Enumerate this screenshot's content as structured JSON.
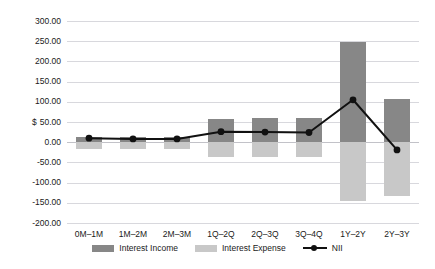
{
  "chart_data": {
    "type": "bar",
    "title": "",
    "xlabel": "",
    "ylabel": "$",
    "ylim": [
      -200,
      300
    ],
    "ytick_step": 50,
    "grid": true,
    "legend_position": "bottom",
    "categories": [
      "0M–1M",
      "1M–2M",
      "2M–3M",
      "1Q–2Q",
      "2Q–3Q",
      "3Q–4Q",
      "1Y–2Y",
      "2Y–3Y"
    ],
    "ytick_labels": [
      "300.00",
      "250.00",
      "200.00",
      "150.00",
      "100.00",
      "50.00",
      "0.00",
      "-50.00",
      "-100.00",
      "-150.00",
      "-200.00"
    ],
    "ytick_values": [
      300,
      250,
      200,
      150,
      100,
      50,
      0,
      -50,
      -100,
      -150,
      -200
    ],
    "series": [
      {
        "name": "Interest Income",
        "type": "bar",
        "color": "#878787",
        "values": [
          14,
          12,
          12,
          58,
          59,
          59,
          247,
          108
        ]
      },
      {
        "name": "Interest Expense",
        "type": "bar",
        "color": "#c8c8c8",
        "values": [
          -18,
          -17,
          -17,
          -36,
          -36,
          -37,
          -145,
          -133
        ]
      },
      {
        "name": "NII",
        "type": "line",
        "color": "#111111",
        "values": [
          10,
          8,
          8,
          26,
          25,
          24,
          105,
          -19
        ]
      }
    ]
  },
  "legend": {
    "items": [
      {
        "label": "Interest Income",
        "icon": "bar-swatch-dark"
      },
      {
        "label": "Interest Expense",
        "icon": "bar-swatch-light"
      },
      {
        "label": "NII",
        "icon": "line-marker"
      }
    ]
  }
}
